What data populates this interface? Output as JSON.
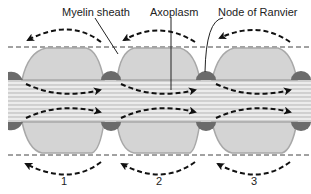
{
  "labels": {
    "myelin": "Myelin sheath",
    "axoplasm": "Axoplasm",
    "node": "Node of Ranvier"
  },
  "segments": [
    "1",
    "2",
    "3"
  ],
  "colors": {
    "myelin_fill": "#d4d4d4",
    "myelin_edge": "#a8a8a8",
    "node_fill": "#6b6b6b",
    "axon_bg": "#ededed",
    "axon_line": "#b5b5b5",
    "arrow": "#111111"
  }
}
